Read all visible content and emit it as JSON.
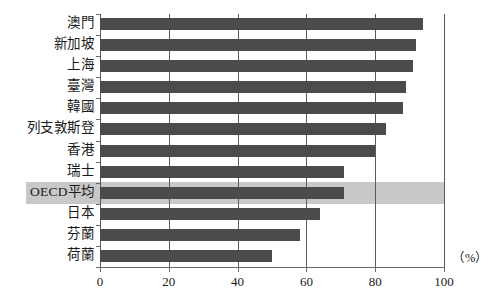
{
  "chart_data": {
    "type": "bar",
    "orientation": "horizontal",
    "title": "",
    "subtitle": "",
    "xlabel": "（%）",
    "ylabel": "",
    "xlim": [
      0,
      100
    ],
    "xticks": [
      0,
      20,
      40,
      60,
      80,
      100
    ],
    "xtick_labels": [
      "0",
      "20",
      "40",
      "60",
      "80",
      "100"
    ],
    "grid": true,
    "grid_axis": "x",
    "legend": null,
    "categories": [
      "澳門",
      "新加坡",
      "上海",
      "臺灣",
      "韓國",
      "列支敦斯登",
      "香港",
      "瑞士",
      "OECD平均",
      "日本",
      "芬蘭",
      "荷蘭"
    ],
    "values": [
      94,
      92,
      91,
      89,
      88,
      83,
      80,
      71,
      71,
      64,
      58,
      50
    ],
    "highlighted_category": "OECD平均",
    "bar_color": "#4b4b4b",
    "highlight_color": "#c8c8c8",
    "gridline_color": "#5a5a5a",
    "background_color": "#ffffff"
  },
  "axis": {
    "unit_label": "（%）"
  }
}
